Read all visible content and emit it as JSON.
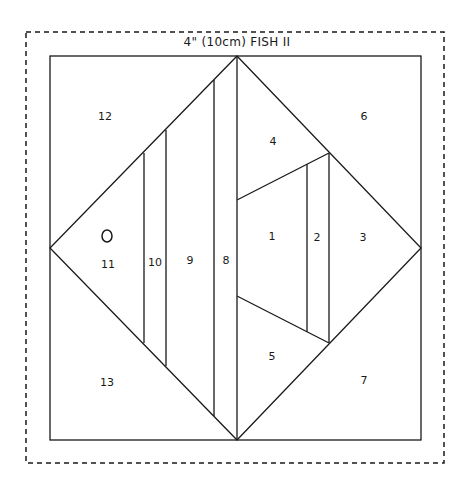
{
  "diagram": {
    "title": "4\" (10cm) FISH II",
    "colors": {
      "line": "#1a1a1a",
      "background": "#ffffff"
    },
    "outer_cut_line": {
      "style": "dashed",
      "x": 26,
      "y": 32,
      "w": 418,
      "h": 431
    },
    "block_border": {
      "style": "solid",
      "x": 50,
      "y": 56,
      "w": 371,
      "h": 384
    },
    "eye": {
      "cx": 107,
      "cy": 236,
      "rx": 5,
      "ry": 6
    },
    "sections": [
      {
        "id": "1",
        "label": "1",
        "x": 272,
        "y": 236
      },
      {
        "id": "2",
        "label": "2",
        "x": 317,
        "y": 237
      },
      {
        "id": "3",
        "label": "3",
        "x": 363,
        "y": 237
      },
      {
        "id": "4",
        "label": "4",
        "x": 273,
        "y": 141
      },
      {
        "id": "5",
        "label": "5",
        "x": 272,
        "y": 356
      },
      {
        "id": "6",
        "label": "6",
        "x": 364,
        "y": 116
      },
      {
        "id": "7",
        "label": "7",
        "x": 364,
        "y": 380
      },
      {
        "id": "8",
        "label": "8",
        "x": 226,
        "y": 260
      },
      {
        "id": "9",
        "label": "9",
        "x": 190,
        "y": 260
      },
      {
        "id": "10",
        "label": "10",
        "x": 155,
        "y": 262
      },
      {
        "id": "11",
        "label": "11",
        "x": 108,
        "y": 264
      },
      {
        "id": "12",
        "label": "12",
        "x": 105,
        "y": 116
      },
      {
        "id": "13",
        "label": "13",
        "x": 107,
        "y": 382
      }
    ]
  }
}
